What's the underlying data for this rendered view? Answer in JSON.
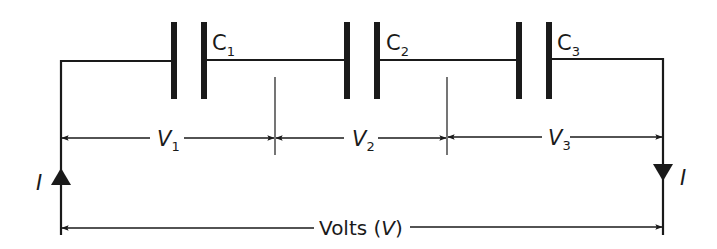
{
  "diagram": {
    "type": "series-capacitor-circuit",
    "capacitors": [
      {
        "name": "C",
        "sub": "1"
      },
      {
        "name": "C",
        "sub": "2"
      },
      {
        "name": "C",
        "sub": "3"
      }
    ],
    "voltage_drops": [
      {
        "name": "V",
        "sub": "1"
      },
      {
        "name": "V",
        "sub": "2"
      },
      {
        "name": "V",
        "sub": "3"
      }
    ],
    "current_left_label": "I",
    "current_right_label": "I",
    "total_voltage": {
      "prefix": "Volts (",
      "symbol": "V",
      "suffix": ")"
    },
    "colors": {
      "line": "#1a1a1a",
      "background": "#ffffff"
    }
  }
}
